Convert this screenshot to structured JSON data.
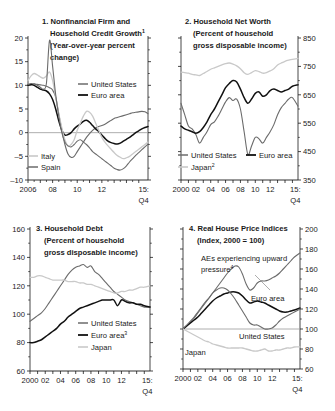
{
  "figure": {
    "panel_count": 4,
    "background": "#ffffff"
  },
  "colors": {
    "united_states": "#6b6b6b",
    "euro_area": "#111111",
    "japan": "#c9c9c9",
    "italy": "#c9c9c9",
    "spain": "#6b6b6b",
    "aes_upward": "#6b6b6b",
    "axis": "#1a1a1a",
    "zero_line": "#9a9a9a"
  },
  "panels": [
    {
      "id": "panel-1",
      "number": "1.",
      "title_lines": [
        "1. Nonfinancial Firm and",
        "Household Credit Growth",
        "(Year-over-year percent",
        "change)"
      ],
      "title_superscript": "1",
      "yticks": [
        "20",
        "15",
        "10",
        "5",
        "0",
        "-5",
        "-10"
      ],
      "ylim": [
        -10,
        20
      ],
      "xticks": [
        "2006",
        "08",
        "10",
        "12",
        "15:"
      ],
      "xtick_last_second_line": "Q4",
      "legend": [
        {
          "label": "United States",
          "color": "#6b6b6b"
        },
        {
          "label": "Euro area",
          "color": "#111111"
        },
        {
          "label": "Italy",
          "color": "#c9c9c9"
        },
        {
          "label": "Spain",
          "color": "#6b6b6b"
        }
      ]
    },
    {
      "id": "panel-2",
      "number": "2.",
      "title_lines": [
        "2. Household Net Worth",
        "(Percent of household",
        "gross disposable income)"
      ],
      "yticks": [
        "850",
        "750",
        "650",
        "550",
        "450",
        "350"
      ],
      "ylim": [
        350,
        850
      ],
      "xticks": [
        "2000",
        "02",
        "04",
        "06",
        "08",
        "10",
        "12",
        "15:"
      ],
      "xtick_last_second_line": "Q4",
      "legend": [
        {
          "label": "United States",
          "color": "#6b6b6b"
        },
        {
          "label": "Euro area",
          "color": "#111111"
        },
        {
          "label": "Japan",
          "color": "#c9c9c9",
          "superscript": "2"
        }
      ]
    },
    {
      "id": "panel-3",
      "number": "3.",
      "title_lines": [
        "3. Household Debt",
        "(Percent of household",
        "gross disposable income)"
      ],
      "yticks": [
        "160",
        "140",
        "120",
        "100",
        "80",
        "60"
      ],
      "ylim": [
        60,
        160
      ],
      "xticks": [
        "2000",
        "02",
        "04",
        "06",
        "08",
        "10",
        "12",
        "15:"
      ],
      "xtick_last_second_line": "Q4",
      "legend": [
        {
          "label": "United States",
          "color": "#6b6b6b"
        },
        {
          "label": "Euro area",
          "color": "#111111",
          "superscript": "3"
        },
        {
          "label": "Japan",
          "color": "#c9c9c9"
        }
      ]
    },
    {
      "id": "panel-4",
      "number": "4.",
      "title_lines": [
        "4. Real House Price Indices",
        "(Index, 2000 = 100)"
      ],
      "yticks": [
        "200",
        "180",
        "160",
        "140",
        "120",
        "100",
        "80",
        "60"
      ],
      "ylim": [
        60,
        200
      ],
      "xticks": [
        "2000",
        "02",
        "04",
        "06",
        "08",
        "10",
        "12",
        "15:"
      ],
      "xtick_last_second_line": "Q4",
      "annotations": [
        {
          "label": "AEs experiencing upward",
          "second_line": "pressure",
          "superscript": "4"
        },
        {
          "label": "Euro area"
        },
        {
          "label": "United States"
        },
        {
          "label": "Japan"
        }
      ]
    }
  ],
  "chart_data": [
    {
      "type": "line",
      "id": "panel-1",
      "title": "1. Nonfinancial Firm and Household Credit Growth (Year-over-year percent change)",
      "xlabel": "",
      "ylabel": "",
      "ylim": [
        -10,
        20
      ],
      "xlim": [
        2006,
        2015.75
      ],
      "grid": false,
      "zero_line": 0,
      "legend_position": "inside",
      "x": [
        2006.0,
        2006.25,
        2006.5,
        2006.75,
        2007.0,
        2007.25,
        2007.5,
        2007.75,
        2008.0,
        2008.25,
        2008.5,
        2008.75,
        2009.0,
        2009.25,
        2009.5,
        2009.75,
        2010.0,
        2010.25,
        2010.5,
        2010.75,
        2011.0,
        2011.25,
        2011.5,
        2011.75,
        2012.0,
        2012.25,
        2012.5,
        2012.75,
        2013.0,
        2013.25,
        2013.5,
        2013.75,
        2014.0,
        2014.25,
        2014.5,
        2014.75,
        2015.0,
        2015.25,
        2015.5,
        2015.75
      ],
      "series": [
        {
          "name": "United States",
          "color": "#6b6b6b",
          "values": [
            10.0,
            10.1,
            10.3,
            10.2,
            10.1,
            10.0,
            9.8,
            9.5,
            9.0,
            7.5,
            4.0,
            0.5,
            -2.5,
            -4.5,
            -5.2,
            -5.0,
            -4.0,
            -3.0,
            -2.0,
            -1.0,
            -0.2,
            0.5,
            1.0,
            1.3,
            1.5,
            1.8,
            2.2,
            2.6,
            3.0,
            3.2,
            3.4,
            3.6,
            3.8,
            4.0,
            4.2,
            4.3,
            4.4,
            4.5,
            4.4,
            4.0
          ]
        },
        {
          "name": "Euro area",
          "color": "#111111",
          "values": [
            10.0,
            10.2,
            10.0,
            9.6,
            9.2,
            9.0,
            8.8,
            8.2,
            7.0,
            5.0,
            2.5,
            0.5,
            -0.5,
            -0.4,
            0.0,
            0.8,
            1.4,
            1.8,
            2.4,
            2.6,
            2.2,
            1.5,
            0.8,
            0.2,
            -0.5,
            -1.2,
            -1.8,
            -2.1,
            -2.3,
            -2.4,
            -2.2,
            -1.8,
            -1.4,
            -1.0,
            -0.5,
            0.0,
            0.4,
            0.8,
            1.1,
            1.3
          ]
        },
        {
          "name": "Italy",
          "color": "#c9c9c9",
          "values": [
            11.0,
            12.0,
            12.5,
            12.2,
            11.8,
            11.5,
            12.0,
            12.8,
            11.0,
            7.5,
            4.0,
            1.0,
            -1.5,
            -2.8,
            -2.5,
            -1.5,
            0.5,
            2.0,
            3.5,
            4.5,
            4.3,
            3.5,
            2.0,
            0.5,
            -1.0,
            -2.0,
            -2.8,
            -3.5,
            -4.2,
            -4.8,
            -5.2,
            -5.5,
            -5.3,
            -5.0,
            -4.5,
            -4.0,
            -3.5,
            -3.0,
            -2.5,
            -2.0
          ]
        },
        {
          "name": "Spain",
          "color": "#6b6b6b",
          "values": [
            10.2,
            10.4,
            10.3,
            10.0,
            9.6,
            9.2,
            10.5,
            19.5,
            14.0,
            8.0,
            3.5,
            0.0,
            -2.0,
            -2.8,
            -3.0,
            -2.5,
            -1.8,
            -1.5,
            -2.0,
            -2.5,
            -3.2,
            -4.0,
            -4.5,
            -5.0,
            -5.5,
            -6.0,
            -6.5,
            -7.0,
            -7.5,
            -7.8,
            -7.9,
            -7.6,
            -7.0,
            -6.2,
            -5.5,
            -4.8,
            -4.2,
            -3.6,
            -3.0,
            -2.4
          ]
        }
      ]
    },
    {
      "type": "line",
      "id": "panel-2",
      "title": "2. Household Net Worth (Percent of household gross disposable income)",
      "xlabel": "",
      "ylabel": "",
      "ylim": [
        350,
        850
      ],
      "xlim": [
        2000,
        2015.75
      ],
      "grid": false,
      "legend_position": "bottom",
      "x": [
        2000.0,
        2000.5,
        2001.0,
        2001.5,
        2002.0,
        2002.5,
        2003.0,
        2003.5,
        2004.0,
        2004.5,
        2005.0,
        2005.5,
        2006.0,
        2006.5,
        2007.0,
        2007.5,
        2008.0,
        2008.5,
        2009.0,
        2009.5,
        2010.0,
        2010.5,
        2011.0,
        2011.5,
        2012.0,
        2012.5,
        2013.0,
        2013.5,
        2014.0,
        2014.5,
        2015.0,
        2015.75
      ],
      "series": [
        {
          "name": "United States",
          "color": "#6b6b6b",
          "values": [
            620,
            580,
            540,
            530,
            510,
            480,
            500,
            520,
            545,
            555,
            575,
            600,
            625,
            640,
            630,
            635,
            600,
            520,
            440,
            470,
            500,
            495,
            480,
            500,
            520,
            545,
            580,
            605,
            620,
            635,
            640,
            610
          ]
        },
        {
          "name": "Euro area",
          "color": "#111111",
          "values": [
            540,
            530,
            525,
            520,
            515,
            520,
            535,
            555,
            580,
            600,
            625,
            650,
            675,
            690,
            700,
            695,
            670,
            640,
            620,
            635,
            655,
            660,
            645,
            650,
            665,
            670,
            665,
            660,
            665,
            670,
            680,
            685
          ]
        },
        {
          "name": "Japan",
          "color": "#c9c9c9",
          "values": [
            730,
            728,
            726,
            722,
            720,
            718,
            725,
            732,
            740,
            745,
            750,
            755,
            760,
            762,
            758,
            752,
            742,
            728,
            722,
            728,
            735,
            732,
            726,
            728,
            734,
            742,
            755,
            762,
            768,
            772,
            775,
            778
          ]
        }
      ]
    },
    {
      "type": "line",
      "id": "panel-3",
      "title": "3. Household Debt (Percent of household gross disposable income)",
      "xlabel": "",
      "ylabel": "",
      "ylim": [
        60,
        160
      ],
      "xlim": [
        2000,
        2015.75
      ],
      "grid": false,
      "legend_position": "inside",
      "x": [
        2000.0,
        2000.5,
        2001.0,
        2001.5,
        2002.0,
        2002.5,
        2003.0,
        2003.5,
        2004.0,
        2004.5,
        2005.0,
        2005.5,
        2006.0,
        2006.5,
        2007.0,
        2007.5,
        2008.0,
        2008.5,
        2009.0,
        2009.5,
        2010.0,
        2010.5,
        2011.0,
        2011.5,
        2012.0,
        2012.5,
        2013.0,
        2013.5,
        2014.0,
        2014.5,
        2015.0,
        2015.75
      ],
      "series": [
        {
          "name": "United States",
          "color": "#6b6b6b",
          "values": [
            95,
            97,
            99,
            101,
            104,
            108,
            112,
            116,
            120,
            124,
            128,
            131,
            133,
            134,
            135,
            133,
            134,
            130,
            128,
            125,
            122,
            119,
            116,
            114,
            112,
            110,
            109,
            108,
            107,
            106,
            105,
            105
          ]
        },
        {
          "name": "Euro area",
          "color": "#111111",
          "values": [
            80,
            80,
            81,
            82,
            84,
            86,
            88,
            90,
            93,
            95,
            98,
            100,
            102,
            104,
            105,
            106,
            107,
            108,
            109,
            110,
            110,
            110,
            110,
            106,
            110,
            109,
            108,
            108,
            107,
            107,
            106,
            105
          ]
        },
        {
          "name": "Japan",
          "color": "#c9c9c9",
          "values": [
            126,
            126,
            127,
            127,
            126,
            125,
            124,
            124,
            124,
            124,
            123,
            123,
            123,
            122,
            122,
            121,
            121,
            120,
            119,
            118,
            117,
            116,
            115,
            115,
            116,
            116,
            117,
            117,
            118,
            119,
            119,
            120
          ]
        }
      ]
    },
    {
      "type": "line",
      "id": "panel-4",
      "title": "4. Real House Price Indices (Index, 2000 = 100)",
      "xlabel": "",
      "ylabel": "",
      "ylim": [
        60,
        200
      ],
      "xlim": [
        2000,
        2015.75
      ],
      "grid": false,
      "reference_line": 100,
      "legend_position": "annotations",
      "x": [
        2000.0,
        2000.5,
        2001.0,
        2001.5,
        2002.0,
        2002.5,
        2003.0,
        2003.5,
        2004.0,
        2004.5,
        2005.0,
        2005.5,
        2006.0,
        2006.5,
        2007.0,
        2007.5,
        2008.0,
        2008.5,
        2009.0,
        2009.5,
        2010.0,
        2010.5,
        2011.0,
        2011.5,
        2012.0,
        2012.5,
        2013.0,
        2013.5,
        2014.0,
        2014.5,
        2015.0,
        2015.75
      ],
      "series": [
        {
          "name": "AEs experiencing upward pressure",
          "color": "#6b6b6b",
          "values": [
            100,
            103,
            107,
            111,
            116,
            121,
            126,
            131,
            136,
            141,
            146,
            151,
            156,
            160,
            163,
            162,
            155,
            145,
            139,
            141,
            146,
            148,
            148,
            149,
            151,
            153,
            156,
            160,
            164,
            168,
            172,
            176
          ]
        },
        {
          "name": "Euro area",
          "color": "#111111",
          "values": [
            100,
            103,
            106,
            109,
            112,
            116,
            120,
            124,
            128,
            131,
            133,
            135,
            136,
            137,
            137,
            136,
            133,
            129,
            126,
            127,
            128,
            127,
            126,
            124,
            122,
            120,
            118,
            117,
            117,
            118,
            119,
            121
          ]
        },
        {
          "name": "United States",
          "color": "#6b6b6b",
          "values": [
            100,
            104,
            108,
            112,
            117,
            122,
            127,
            131,
            136,
            139,
            141,
            141,
            139,
            135,
            130,
            124,
            118,
            112,
            106,
            104,
            104,
            102,
            100,
            100,
            101,
            104,
            108,
            111,
            113,
            115,
            117,
            120
          ]
        },
        {
          "name": "Japan",
          "color": "#c9c9c9",
          "values": [
            100,
            98,
            96,
            94,
            92,
            90,
            88,
            87,
            85,
            84,
            83,
            82,
            81,
            81,
            81,
            81,
            81,
            80,
            79,
            78,
            78,
            79,
            80,
            78,
            78,
            79,
            79,
            80,
            81,
            81,
            82,
            82
          ]
        }
      ]
    }
  ]
}
